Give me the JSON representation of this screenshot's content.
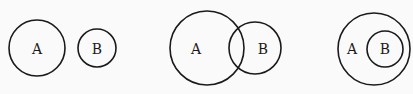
{
  "diagrams": [
    {
      "relation": "disjoint",
      "circles": [
        {
          "label": "A",
          "cx": 37,
          "cy": 48,
          "r": 28,
          "lx": 37,
          "ly": 49
        },
        {
          "label": "B",
          "cx": 97,
          "cy": 48,
          "r": 19,
          "lx": 97,
          "ly": 49
        }
      ]
    },
    {
      "relation": "overlapping",
      "circles": [
        {
          "label": "A",
          "cx": 207,
          "cy": 48,
          "r": 37,
          "lx": 196,
          "ly": 49
        },
        {
          "label": "B",
          "cx": 255,
          "cy": 48,
          "r": 26,
          "lx": 263,
          "ly": 49
        }
      ]
    },
    {
      "relation": "subset",
      "circles": [
        {
          "label": "A",
          "cx": 374,
          "cy": 49,
          "r": 36,
          "lx": 352,
          "ly": 49
        },
        {
          "label": "B",
          "cx": 385,
          "cy": 49,
          "r": 18,
          "lx": 385,
          "ly": 49
        }
      ]
    }
  ],
  "colors": {
    "stroke": "#1a1a1a",
    "background": "#fafafa"
  }
}
